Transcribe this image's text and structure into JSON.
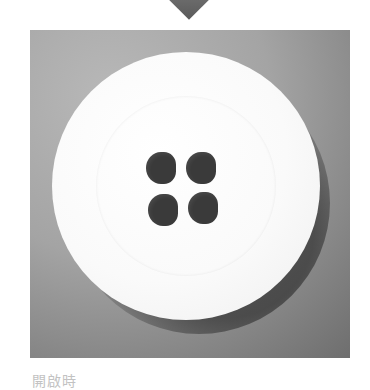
{
  "image": {
    "subject": "white plate with four dark dots on gray background",
    "colors": {
      "background_light": "#b8b8b8",
      "background_dark": "#6e6e6e",
      "plate": "#fafafa",
      "dots": "#3a3a3a",
      "arrow": "#6a6a6a",
      "caption": "#c2c2c2"
    }
  },
  "indicators": {
    "top_arrow_icon": "diamond-down-arrow"
  },
  "caption": {
    "text": "開啟時"
  }
}
